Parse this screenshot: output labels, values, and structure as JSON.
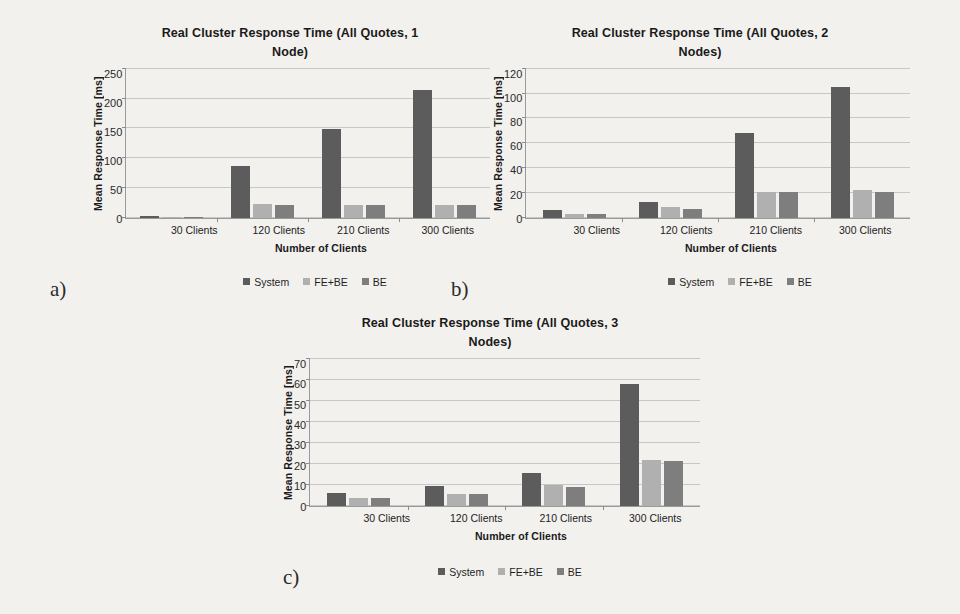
{
  "figure": {
    "background_color": "#f3f1ee",
    "series_colors": [
      "#5c5c5c",
      "#b0b0b0",
      "#7e7e7e"
    ]
  },
  "panels": [
    {
      "caption": "a)",
      "chart_data": {
        "type": "bar",
        "title": "Real Cluster Response Time (All Quotes, 1 Node)",
        "title_lines": [
          "Real Cluster Response Time (All Quotes, 1",
          "Node)"
        ],
        "xlabel": "Number of Clients",
        "ylabel": "Mean Response Time [ms]",
        "categories": [
          "30 Clients",
          "120 Clients",
          "210 Clients",
          "300 Clients"
        ],
        "series": [
          {
            "name": "System",
            "values": [
              3,
              87,
              149,
              214
            ]
          },
          {
            "name": "FE+BE",
            "values": [
              2,
              23,
              22,
              22
            ]
          },
          {
            "name": "BE",
            "values": [
              1,
              22,
              22,
              22
            ]
          }
        ],
        "ylim": [
          0,
          250
        ],
        "ytick_step": 50,
        "yticks": [
          250,
          200,
          150,
          100,
          50,
          0
        ],
        "grid": true,
        "legend_position": "bottom"
      }
    },
    {
      "caption": "b)",
      "chart_data": {
        "type": "bar",
        "title": "Real Cluster Response Time (All Quotes, 2 Nodes)",
        "title_lines": [
          "Real Cluster Response Time (All Quotes, 2",
          "Nodes)"
        ],
        "xlabel": "Number of Clients",
        "ylabel": "Mean Response Time [ms]",
        "categories": [
          "30 Clients",
          "120 Clients",
          "210 Clients",
          "300 Clients"
        ],
        "series": [
          {
            "name": "System",
            "values": [
              6,
              13,
              68,
              105
            ]
          },
          {
            "name": "FE+BE",
            "values": [
              3,
              9,
              21,
              22
            ]
          },
          {
            "name": "BE",
            "values": [
              3,
              7,
              21,
              21
            ]
          }
        ],
        "ylim": [
          0,
          120
        ],
        "ytick_step": 20,
        "yticks": [
          120,
          100,
          80,
          60,
          40,
          20,
          0
        ],
        "grid": true,
        "legend_position": "bottom"
      }
    },
    {
      "caption": "c)",
      "chart_data": {
        "type": "bar",
        "title": "Real Cluster Response Time (All Quotes, 3 Nodes)",
        "title_lines": [
          "Real Cluster Response Time (All Quotes, 3",
          "Nodes)"
        ],
        "xlabel": "Number of Clients",
        "ylabel": "Mean Response Time [ms]",
        "categories": [
          "30 Clients",
          "120 Clients",
          "210 Clients",
          "300 Clients"
        ],
        "series": [
          {
            "name": "System",
            "values": [
              6,
              9.5,
              15.5,
              58
            ]
          },
          {
            "name": "FE+BE",
            "values": [
              3.5,
              5.5,
              10,
              22
            ]
          },
          {
            "name": "BE",
            "values": [
              3.5,
              5.5,
              9,
              21.5
            ]
          }
        ],
        "ylim": [
          0,
          70
        ],
        "ytick_step": 10,
        "yticks": [
          70,
          60,
          50,
          40,
          30,
          20,
          10,
          0
        ],
        "grid": true,
        "legend_position": "bottom"
      }
    }
  ]
}
